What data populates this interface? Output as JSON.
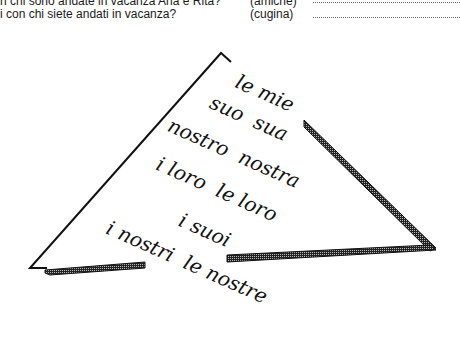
{
  "questions": [
    {
      "text": "n chi sono andate in vacanza Ana e Rita?",
      "hint": "(amiche)",
      "answer": ""
    },
    {
      "text": "i con chi siete andati in vacanza?",
      "hint": "(cugina)",
      "answer": ""
    }
  ],
  "triangle": {
    "words": [
      {
        "text": "le mie",
        "x": 265,
        "y": 93
      },
      {
        "text": "suo  sua",
        "x": 249,
        "y": 118
      },
      {
        "text": "nostro  nostra",
        "x": 234,
        "y": 153
      },
      {
        "text": "i loro  le loro",
        "x": 217,
        "y": 189
      },
      {
        "text": "i suoi",
        "x": 205,
        "y": 230
      },
      {
        "text": "i nostri  le nostre",
        "x": 187,
        "y": 262
      }
    ]
  }
}
